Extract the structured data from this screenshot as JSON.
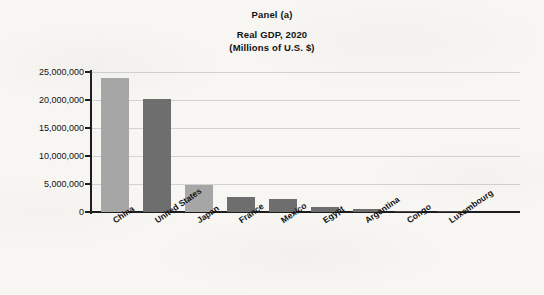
{
  "chart_data": {
    "type": "bar",
    "title": "Panel (a)",
    "subtitle": "Real GDP, 2020",
    "units_line": "(Millions of U.S. $)",
    "xlabel": "",
    "ylabel": "",
    "ylim": [
      0,
      25000000
    ],
    "grid": true,
    "legend": "none",
    "categories": [
      "China",
      "United States",
      "Japan",
      "France",
      "Mexico",
      "Egypt",
      "Argentina",
      "Congo",
      "Luxembourg"
    ],
    "values": [
      23900000,
      20100000,
      4900000,
      2700000,
      2300000,
      900000,
      500000,
      60000,
      50000
    ],
    "bar_colors": [
      "#a6a6a6",
      "#6e6e6e",
      "#a6a6a6",
      "#6e6e6e",
      "#6e6e6e",
      "#6e6e6e",
      "#6e6e6e",
      "#4a4a4a",
      "#4a4a4a"
    ],
    "y_ticks": [
      0,
      5000000,
      10000000,
      15000000,
      20000000,
      25000000
    ],
    "y_tick_labels": [
      "0",
      "5,000,000",
      "10,000,000",
      "15,000,000",
      "20,000,000",
      "25,000,000"
    ],
    "axis_color": "#1d1d1d",
    "gridline_color": "#d2d2d2",
    "background_color": "#f7f6f3"
  }
}
